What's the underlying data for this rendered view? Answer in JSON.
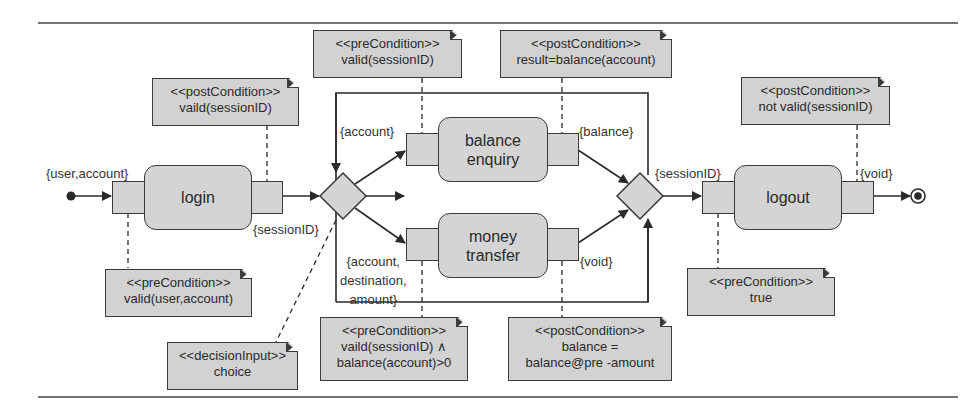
{
  "diagram": {
    "type": "UML activity diagram",
    "actions": {
      "login": "login",
      "balance_enquiry": [
        "balance",
        "enquiry"
      ],
      "money_transfer": [
        "money",
        "transfer"
      ],
      "logout": "logout"
    },
    "pin_labels": {
      "login_in": "{user,account}",
      "login_out": "{sessionID}",
      "balance_in": "{account}",
      "balance_out": "{balance}",
      "transfer_in": [
        "{account,",
        "destination,",
        "amount}"
      ],
      "transfer_out": "{void}",
      "logout_in": "{sessionID}",
      "logout_out": "{void}"
    },
    "notes": {
      "login_post": {
        "stereotype": "<<postCondition>>",
        "body": [
          "vaild(sessionID)"
        ]
      },
      "login_pre": {
        "stereotype": "<<preCondition>>",
        "body": [
          "valid(user,account)"
        ]
      },
      "balance_pre": {
        "stereotype": "<<preCondition>>",
        "body": [
          "valid(sessionID)"
        ]
      },
      "balance_post": {
        "stereotype": "<<postCondition>>",
        "body": [
          "result=balance(account)"
        ]
      },
      "decision_input": {
        "stereotype": "<<decisionInput>>",
        "body": [
          "choice"
        ]
      },
      "transfer_pre": {
        "stereotype": "<<preCondition>>",
        "body": [
          "vaild(sessionID) ∧",
          "balance(account)>0"
        ]
      },
      "transfer_post": {
        "stereotype": "<<postCondition>>",
        "body": [
          "balance =",
          "balance@pre -amount"
        ]
      },
      "logout_post": {
        "stereotype": "<<postCondition>>",
        "body": [
          "not valid(sessionID)"
        ]
      },
      "logout_pre": {
        "stereotype": "<<preCondition>>",
        "body": [
          "true"
        ]
      }
    },
    "colors": {
      "fill": "#d4d4d4",
      "stroke": "#3a3a3a",
      "background": "#ffffff"
    }
  }
}
